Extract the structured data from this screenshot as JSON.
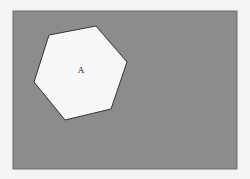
{
  "canvas": {
    "background": "#f4f4f4",
    "rect": {
      "x": 13,
      "y": 11,
      "width": 224,
      "height": 158,
      "fill": "#8c8c8c",
      "stroke": "#6a6a6a"
    }
  },
  "shapes": [
    {
      "type": "hexagon",
      "label": "A",
      "fill": "#f7f7f7",
      "stroke": "#333333",
      "points": "49,35 96,26 127,62 111,109 65,120 34,82",
      "label_pos": {
        "x": 81,
        "y": 73
      }
    }
  ]
}
